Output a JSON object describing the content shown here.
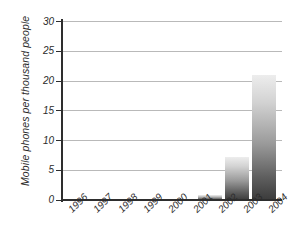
{
  "chart_data": {
    "type": "bar",
    "title": "",
    "xlabel": "",
    "ylabel": "Mobile phones per thousand people",
    "categories": [
      "1996",
      "1997",
      "1998",
      "1999",
      "2000",
      "2001",
      "2002",
      "2003",
      "2004"
    ],
    "values": [
      0,
      0,
      0,
      0,
      0,
      0,
      0.8,
      7.2,
      21
    ],
    "ylim": [
      0,
      30
    ],
    "yticks": [
      0,
      5,
      10,
      15,
      20,
      25,
      30
    ],
    "ytick_labels": [
      "0",
      "5",
      "10",
      "15",
      "20",
      "25",
      "30"
    ],
    "grid": true,
    "legend": null,
    "series": [
      {
        "name": "Mobile phones per thousand people",
        "values": [
          0,
          0,
          0,
          0,
          0,
          0,
          0.8,
          7.2,
          21
        ]
      }
    ],
    "colors": {
      "bar_top": "#ededed",
      "bar_bottom": "#3b3b3b",
      "gridline": "#b9b9b9",
      "axis": "#2e2e2e",
      "text": "#2b2b2b",
      "background": "#ffffff"
    }
  }
}
